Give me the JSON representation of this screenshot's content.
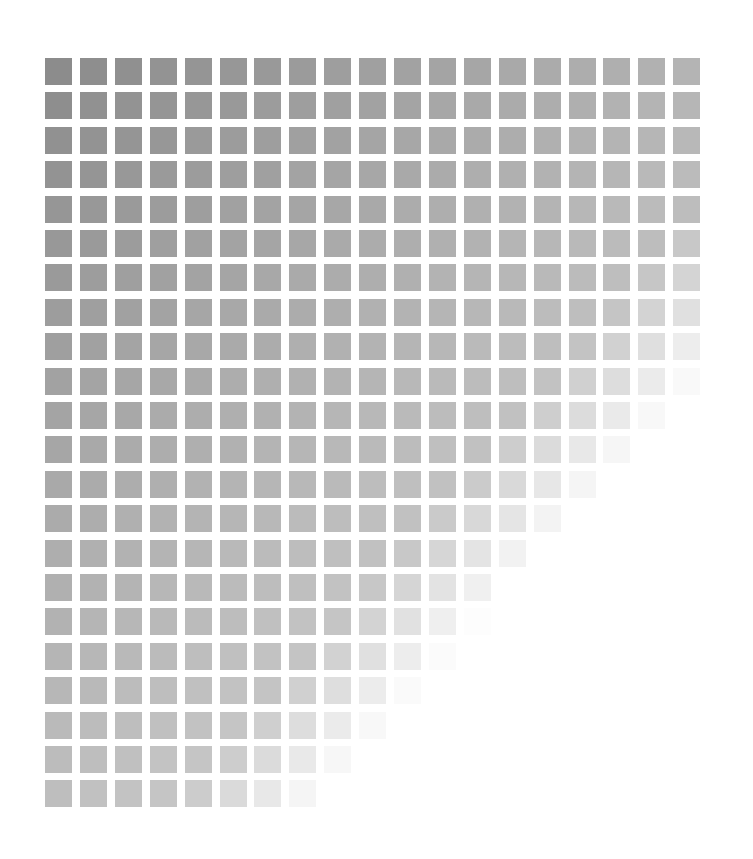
{
  "canvas": {
    "width": 753,
    "height": 859,
    "background": "#ffffff"
  },
  "grid": {
    "columns": 19,
    "rows": 22,
    "origin_x": 45,
    "origin_y": 58,
    "pitch_x": 34.9,
    "pitch_y": 34.4,
    "cell_width": 27,
    "cell_height": 27
  },
  "gradient": {
    "description": "Gray squares fading from dark gray at top-left to white at bottom-right",
    "top_left_color": "#8c8c8c",
    "top_right_color": "#b4b4b4",
    "bottom_left_color": "#bebebe",
    "bottom_right_color": "#ffffff",
    "base_level": 140,
    "step_per_column": 2.2,
    "step_per_row": 2.4,
    "fade_threshold": 1.2,
    "fade_strength": 210,
    "max_level": 255
  }
}
